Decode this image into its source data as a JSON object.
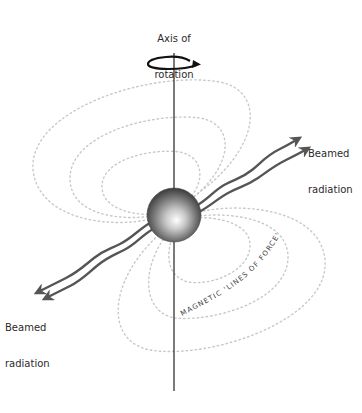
{
  "diagram": {
    "type": "pulsar-magnetic-field",
    "labels": {
      "axis": [
        "Axis of",
        "rotation"
      ],
      "beam_top": [
        "Beamed",
        "radiation"
      ],
      "beam_bottom": [
        "Beamed",
        "radiation"
      ],
      "field_lines": "MAGNETIC 'LINES OF FORCE'"
    },
    "colors": {
      "axis_line": "#333333",
      "rotation_arrow": "#111111",
      "beam": "#555555",
      "field_lines": "#c8c8c8",
      "sphere_light": "#ffffff",
      "sphere_dark": "#3a3a3a",
      "text": "#2b2b2b"
    },
    "elements": {
      "rotation_axis": "vertical line through star",
      "star": "neutron star sphere",
      "beams": "two wavy beams along magnetic axis, each direction",
      "field_loops": "dotted magnetic field loops, three per side"
    }
  }
}
